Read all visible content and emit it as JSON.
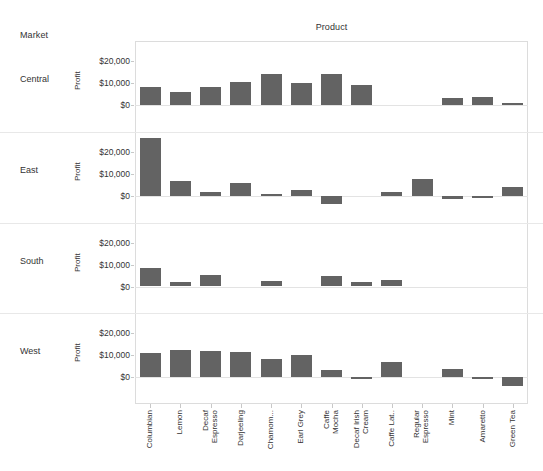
{
  "header": {
    "row_field_label": "Market",
    "column_field_label": "Product"
  },
  "axis": {
    "y_title": "Profit",
    "y_ticks": [
      "$20,000",
      "$10,000",
      "$0"
    ],
    "y_tick_values": [
      20000,
      10000,
      0
    ]
  },
  "markets": [
    "Central",
    "East",
    "South",
    "West"
  ],
  "products": [
    {
      "label_line1": "Columbian",
      "label_line2": ""
    },
    {
      "label_line1": "Lemon",
      "label_line2": ""
    },
    {
      "label_line1": "Decaf",
      "label_line2": "Espresso"
    },
    {
      "label_line1": "Darjeeling",
      "label_line2": ""
    },
    {
      "label_line1": "Chamom...",
      "label_line2": ""
    },
    {
      "label_line1": "Earl Grey",
      "label_line2": ""
    },
    {
      "label_line1": "Caffe",
      "label_line2": "Mocha"
    },
    {
      "label_line1": "Decaf Irish",
      "label_line2": "Cream"
    },
    {
      "label_line1": "Caffe Lat..",
      "label_line2": ""
    },
    {
      "label_line1": "Regular",
      "label_line2": "Espresso"
    },
    {
      "label_line1": "Mint",
      "label_line2": ""
    },
    {
      "label_line1": "Amaretto",
      "label_line2": ""
    },
    {
      "label_line1": "Green Tea",
      "label_line2": ""
    }
  ],
  "chart_data": {
    "type": "bar",
    "title": "",
    "xlabel": "Product",
    "ylabel": "Profit",
    "ylim": [
      -6000,
      28000
    ],
    "grid": false,
    "legend": "none",
    "layout": "small-multiples, 4 rows (Market) x 13 columns (Product)",
    "bar_color": "#636363",
    "categories": [
      "Columbian",
      "Lemon",
      "Decaf Espresso",
      "Darjeeling",
      "Chamomile",
      "Earl Grey",
      "Caffe Mocha",
      "Decaf Irish Cream",
      "Caffe Latte",
      "Regular Espresso",
      "Mint",
      "Amaretto",
      "Green Tea"
    ],
    "series": [
      {
        "name": "Central",
        "values": [
          8100,
          5700,
          8300,
          10600,
          14100,
          10000,
          14100,
          9100,
          null,
          null,
          3000,
          3800,
          700
        ]
      },
      {
        "name": "East",
        "values": [
          26300,
          6900,
          1700,
          5800,
          400,
          2500,
          -3600,
          null,
          1600,
          7400,
          -1600,
          -200,
          4200
        ]
      },
      {
        "name": "South",
        "values": [
          8300,
          2000,
          5300,
          null,
          2600,
          null,
          4600,
          2000,
          3000,
          null,
          null,
          null,
          null
        ]
      },
      {
        "name": "West",
        "values": [
          11200,
          12600,
          12100,
          11300,
          8300,
          10100,
          3400,
          -1000,
          6900,
          null,
          3700,
          -700,
          -4200
        ]
      }
    ]
  }
}
